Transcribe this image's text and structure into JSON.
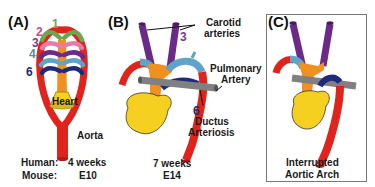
{
  "panels": {
    "a": {
      "letter": "(A)",
      "arch_numbers": [
        "1",
        "2",
        "3",
        "4",
        "6"
      ],
      "heart_label": "Heart",
      "aorta_label": "Aorta",
      "stage_rows": [
        {
          "species": "Human:",
          "value": "4 weeks"
        },
        {
          "species": "Mouse:",
          "value": "E10"
        }
      ]
    },
    "b": {
      "letter": "(B)",
      "carotid_label_line1": "Carotid",
      "carotid_label_line2": "arteries",
      "carotid_number": "3",
      "pulmonary_label_line1": "Pulmonary",
      "pulmonary_label_line2": "Artery",
      "ductus_number": "6",
      "ductus_label_line1": "Ductus",
      "ductus_label_line2": "Arteriosis",
      "stage_line1": "7 weeks",
      "stage_line2": "E14"
    },
    "c": {
      "letter": "(C)",
      "caption_line1": "Interrupted",
      "caption_line2": "Aortic Arch"
    }
  },
  "colors": {
    "aorta_red": "#e0231b",
    "arch1_green": "#6aa84f",
    "arch2_pink": "#e67aa8",
    "arch3_purple": "#6b2a8a",
    "arch4_blue": "#5ea3c8",
    "arch6_navy": "#1e2a7a",
    "trunk_orange": "#f0901e",
    "heart_yellow": "#f5d020",
    "pulmonary_gray": "#808080",
    "label_num1": "#6aa84f",
    "label_num2": "#c2508a",
    "label_num3": "#7a3a8a",
    "label_num4": "#4f8fa8",
    "label_num6": "#1e2a7a"
  }
}
